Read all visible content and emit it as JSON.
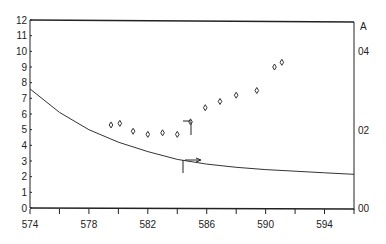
{
  "chart_data": {
    "type": "scatter",
    "title": "",
    "xlabel": "",
    "ylabel": "",
    "y2label": "A",
    "xlim": [
      574,
      596
    ],
    "ylim": [
      0,
      12
    ],
    "y2lim": [
      0,
      0.48
    ],
    "x_ticks": [
      574,
      576,
      578,
      580,
      582,
      584,
      586,
      588,
      590,
      592,
      594,
      596
    ],
    "x_tick_labels": [
      "574",
      "578",
      "582",
      "586",
      "590",
      "594"
    ],
    "x_tick_label_values": [
      574,
      578,
      582,
      586,
      590,
      594
    ],
    "y_ticks": [
      0,
      1,
      2,
      3,
      4,
      5,
      6,
      7,
      8,
      9,
      10,
      11,
      12
    ],
    "y_tick_labels": [
      "0",
      "1",
      "2",
      "3",
      "4",
      "5",
      "6",
      "7",
      "8",
      "9",
      "10",
      "11",
      "12"
    ],
    "y2_tick_labels": [
      "00",
      "02",
      "04"
    ],
    "y2_tick_values": [
      0,
      0.2,
      0.4
    ],
    "grid": false,
    "legend": null,
    "series": [
      {
        "name": "points",
        "marker": "open-diamond",
        "x": [
          579.5,
          580.1,
          581.0,
          582.0,
          583.0,
          584.0,
          584.9,
          585.9,
          586.9,
          588.0,
          589.4,
          590.6,
          591.1
        ],
        "y": [
          5.3,
          5.4,
          4.9,
          4.7,
          4.8,
          4.7,
          5.5,
          6.4,
          6.8,
          7.2,
          7.5,
          9.0,
          9.3
        ]
      },
      {
        "name": "curve",
        "type": "line",
        "x": [
          574,
          576,
          578,
          580,
          582,
          584,
          586,
          588,
          590,
          592,
          594,
          596
        ],
        "y": [
          7.6,
          6.1,
          5.0,
          4.2,
          3.6,
          3.1,
          2.8,
          2.6,
          2.45,
          2.35,
          2.25,
          2.15
        ]
      }
    ],
    "annotations": [
      {
        "type": "marker-bracket",
        "x": 584.9,
        "y": 5.5,
        "desc": "horizontal tick left and vertical line down from point"
      },
      {
        "type": "arrow",
        "x": 584.3,
        "y": 3.0,
        "desc": "vertical tick below curve with arrow pointing right along curve"
      }
    ]
  }
}
